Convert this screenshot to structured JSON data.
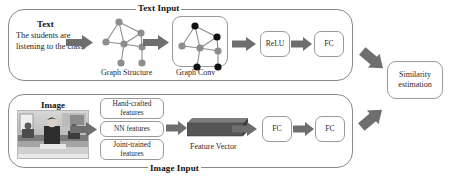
{
  "figure": {
    "type": "architecture-diagram",
    "background_color": "#ffffff",
    "outline_color": "#8a8a8a",
    "arrow_color": "#6e6e6e"
  },
  "text_branch": {
    "title": "Text Input",
    "section_label": "Text",
    "sentence": "The students are listening to the class.",
    "graph_structure_caption": "Graph Structure",
    "graph_conv_caption": "Graph Conv",
    "relu_label": "ReLU",
    "fc_label": "FC",
    "graph_structure": {
      "node_color": "#8d8d8d",
      "edge_color": "#8d8d8d",
      "nodes": [
        {
          "id": "n1",
          "x": 21,
          "y": 8,
          "color": "#8d8d8d"
        },
        {
          "id": "n2",
          "x": 43,
          "y": 19,
          "color": "#8d8d8d"
        },
        {
          "id": "n3",
          "x": 8,
          "y": 28,
          "color": "#8d8d8d"
        },
        {
          "id": "n4",
          "x": 26,
          "y": 30,
          "color": "#8d8d8d"
        },
        {
          "id": "n5",
          "x": 44,
          "y": 33,
          "color": "#8d8d8d"
        },
        {
          "id": "n6",
          "x": 23,
          "y": 49,
          "color": "#8d8d8d"
        },
        {
          "id": "n7",
          "x": 44,
          "y": 49,
          "color": "#8d8d8d"
        }
      ],
      "edges": [
        [
          "n1",
          "n2"
        ],
        [
          "n1",
          "n3"
        ],
        [
          "n1",
          "n4"
        ],
        [
          "n2",
          "n4"
        ],
        [
          "n3",
          "n4"
        ],
        [
          "n4",
          "n5"
        ],
        [
          "n4",
          "n6"
        ],
        [
          "n5",
          "n7"
        ],
        [
          "n2",
          "n5"
        ]
      ]
    },
    "graph_conv": {
      "nodes": [
        {
          "id": "m1",
          "x": 21,
          "y": 8,
          "color": "#111111"
        },
        {
          "id": "m2",
          "x": 43,
          "y": 19,
          "color": "#111111"
        },
        {
          "id": "m3",
          "x": 8,
          "y": 28,
          "color": "#8d8d8d"
        },
        {
          "id": "m4",
          "x": 26,
          "y": 30,
          "color": "#8d8d8d"
        },
        {
          "id": "m5",
          "x": 44,
          "y": 33,
          "color": "#8d8d8d"
        },
        {
          "id": "m6",
          "x": 23,
          "y": 49,
          "color": "#111111"
        },
        {
          "id": "m7",
          "x": 44,
          "y": 49,
          "color": "#111111"
        }
      ],
      "edges": [
        [
          "m1",
          "m2"
        ],
        [
          "m1",
          "m3"
        ],
        [
          "m1",
          "m4"
        ],
        [
          "m2",
          "m4"
        ],
        [
          "m3",
          "m4"
        ],
        [
          "m4",
          "m5"
        ],
        [
          "m4",
          "m6"
        ],
        [
          "m5",
          "m7"
        ],
        [
          "m2",
          "m5"
        ]
      ]
    }
  },
  "image_branch": {
    "title": "Image Input",
    "section_label": "Image",
    "thumbnail_description": "grayscale classroom photo",
    "feature_options": [
      "Hand-crafted features",
      "NN features",
      "Joint-trained features"
    ],
    "feature_vector_caption": "Feature Vector",
    "feature_vector_color": "#5c5c5c",
    "fc_labels": [
      "FC",
      "FC"
    ]
  },
  "output": {
    "label": "Similarity estimation"
  }
}
